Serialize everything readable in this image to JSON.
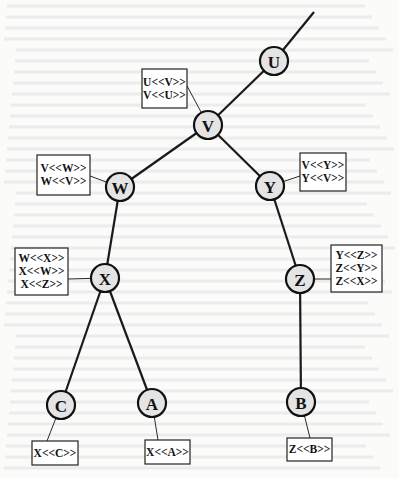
{
  "diagram": {
    "title": "",
    "root_edge": {
      "from": [
        314,
        12
      ],
      "to": "U"
    },
    "nodes": [
      {
        "id": "U",
        "label": "U",
        "x": 274,
        "y": 61
      },
      {
        "id": "V",
        "label": "V",
        "x": 208,
        "y": 125
      },
      {
        "id": "W",
        "label": "W",
        "x": 120,
        "y": 187
      },
      {
        "id": "Y",
        "label": "Y",
        "x": 270,
        "y": 186
      },
      {
        "id": "X",
        "label": "X",
        "x": 105,
        "y": 278
      },
      {
        "id": "Z",
        "label": "Z",
        "x": 300,
        "y": 279
      },
      {
        "id": "C",
        "label": "C",
        "x": 61,
        "y": 405
      },
      {
        "id": "A",
        "label": "A",
        "x": 152,
        "y": 403
      },
      {
        "id": "B",
        "label": "B",
        "x": 301,
        "y": 402
      }
    ],
    "edges": [
      {
        "from": "U",
        "to": "V"
      },
      {
        "from": "V",
        "to": "W"
      },
      {
        "from": "V",
        "to": "Y"
      },
      {
        "from": "W",
        "to": "X"
      },
      {
        "from": "Y",
        "to": "Z"
      },
      {
        "from": "X",
        "to": "C"
      },
      {
        "from": "X",
        "to": "A"
      },
      {
        "from": "Z",
        "to": "B"
      }
    ],
    "boxes": [
      {
        "node": "V",
        "x": 142,
        "y": 69,
        "w": 45,
        "h": 39,
        "anchor": [
          186,
          84
        ],
        "lines": [
          "U<<V>>",
          "V<<U>>"
        ]
      },
      {
        "node": "W",
        "x": 37,
        "y": 155,
        "w": 53,
        "h": 40,
        "anchor": [
          90,
          176
        ],
        "lines": [
          "V<<W>>",
          "W<<V>>"
        ]
      },
      {
        "node": "Y",
        "x": 300,
        "y": 153,
        "w": 46,
        "h": 38,
        "anchor": [
          300,
          176
        ],
        "lines": [
          "V<<Y>>",
          "Y<<V>>"
        ]
      },
      {
        "node": "X",
        "x": 15,
        "y": 248,
        "w": 53,
        "h": 47,
        "anchor": [
          68,
          279
        ],
        "lines": [
          "W<<X>>",
          "X<<W>>",
          "X<<Z>>"
        ]
      },
      {
        "node": "Z",
        "x": 331,
        "y": 245,
        "w": 51,
        "h": 47,
        "anchor": [
          331,
          279
        ],
        "lines": [
          "Y<<Z>>",
          "Z<<Y>>",
          "Z<<X>>"
        ]
      },
      {
        "node": "C",
        "x": 32,
        "y": 441,
        "w": 46,
        "h": 24,
        "anchor": [
          47,
          441
        ],
        "lines": [
          "X<<C>>"
        ]
      },
      {
        "node": "A",
        "x": 145,
        "y": 440,
        "w": 45,
        "h": 24,
        "anchor": [
          158,
          440
        ],
        "lines": [
          "X<<A>>"
        ]
      },
      {
        "node": "B",
        "x": 287,
        "y": 438,
        "w": 45,
        "h": 23,
        "anchor": [
          310,
          438
        ],
        "lines": [
          "Z<<B>>"
        ]
      }
    ],
    "style": {
      "node_radius": 14,
      "node_fill": "#e4e4e4",
      "node_stroke": "#111111",
      "edge_color": "#1a1a1a",
      "box_stroke": "#222222",
      "background": "#fbfbfa"
    }
  }
}
